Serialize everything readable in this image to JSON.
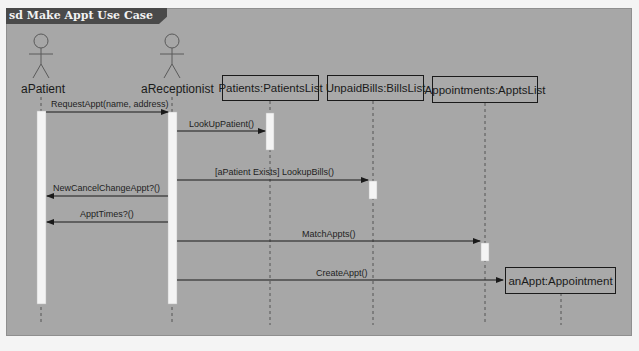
{
  "diagram": {
    "title": "sd Make Appt Use Case",
    "type": "UML sequence diagram",
    "colors": {
      "background": "#a7a7a7",
      "title_tab": "#4a4a4a",
      "activation": "#f4f4f4",
      "line": "#1a1a1a"
    }
  },
  "actors": [
    {
      "id": "patient",
      "label": "aPatient",
      "icon": "stick-figure-icon"
    },
    {
      "id": "receptionist",
      "label": "aReceptionist",
      "icon": "stick-figure-icon"
    }
  ],
  "objects": [
    {
      "id": "patients",
      "label": "Patients:PatientsList"
    },
    {
      "id": "bills",
      "label": "UnpaidBills:BillsList"
    },
    {
      "id": "appts",
      "label": "Appointments:ApptsList"
    },
    {
      "id": "anappt",
      "label": "anAppt:Appointment"
    }
  ],
  "messages": [
    {
      "from": "aPatient",
      "to": "aReceptionist",
      "label": "RequestAppt(name, address)"
    },
    {
      "from": "aReceptionist",
      "to": "Patients:PatientsList",
      "label": "LookUpPatient()"
    },
    {
      "from": "aReceptionist",
      "to": "UnpaidBills:BillsList",
      "label": "[aPatient Exists] LookupBills()"
    },
    {
      "from": "aReceptionist",
      "to": "aPatient",
      "label": "NewCancelChangeAppt?()"
    },
    {
      "from": "aReceptionist",
      "to": "aPatient",
      "label": "ApptTimes?()"
    },
    {
      "from": "aReceptionist",
      "to": "Appointments:ApptsList",
      "label": "MatchAppts()"
    },
    {
      "from": "aReceptionist",
      "to": "anAppt:Appointment",
      "label": "CreateAppt()"
    }
  ]
}
